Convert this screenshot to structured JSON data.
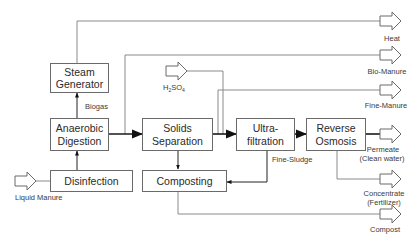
{
  "diagram": {
    "type": "process-flow",
    "boxes": {
      "steam_generator": {
        "line1": "Steam",
        "line2": "Generator"
      },
      "anaerobic_digestion": {
        "line1": "Anaerobic",
        "line2": "Digestion"
      },
      "disinfection": {
        "label": "Disinfection"
      },
      "solids_separation": {
        "line1": "Solids",
        "line2": "Separation"
      },
      "composting": {
        "label": "Composting"
      },
      "ultrafiltration": {
        "line1": "Ultra-",
        "line2": "filtration"
      },
      "reverse_osmosis": {
        "line1": "Reverse",
        "line2": "Osmosis"
      }
    },
    "inputs": {
      "liquid_manure": "Liquid Manure",
      "h2so4": {
        "base": "H",
        "sub1": "2",
        "mid": "SO",
        "sub2": "4"
      }
    },
    "flow_labels": {
      "biogas": "Biogas",
      "fine_sludge": "Fine-Sludge"
    },
    "outputs": {
      "heat": "Heat",
      "bio_manure": "Bio-Manure",
      "fine_manure": "Fine-Manure",
      "permeate": {
        "line1": "Permeate",
        "line2": "(Clean water)"
      },
      "concentrate": {
        "line1": "Concentrate",
        "line2": "(Fertilizer)"
      },
      "compost": "Compost"
    },
    "edges": [
      {
        "from": "Liquid Manure",
        "to": "Disinfection"
      },
      {
        "from": "Disinfection",
        "to": "Anaerobic Digestion"
      },
      {
        "from": "Anaerobic Digestion",
        "to": "Steam Generator",
        "label": "Biogas"
      },
      {
        "from": "Steam Generator",
        "to": "Heat"
      },
      {
        "from": "Anaerobic Digestion",
        "to": "Solids Separation"
      },
      {
        "from": "Anaerobic Digestion",
        "to": "Bio-Manure"
      },
      {
        "from": "H2SO4",
        "to": "Ultrafiltration feed"
      },
      {
        "from": "Solids Separation",
        "to": "Ultrafiltration"
      },
      {
        "from": "Solids Separation",
        "to": "Fine-Manure"
      },
      {
        "from": "Solids Separation",
        "to": "Composting"
      },
      {
        "from": "Ultrafiltration",
        "to": "Reverse Osmosis"
      },
      {
        "from": "Ultrafiltration",
        "to": "Composting",
        "label": "Fine-Sludge"
      },
      {
        "from": "Reverse Osmosis",
        "to": "Permeate (Clean water)"
      },
      {
        "from": "Reverse Osmosis",
        "to": "Concentrate (Fertilizer)"
      },
      {
        "from": "Composting",
        "to": "Compost"
      }
    ]
  }
}
